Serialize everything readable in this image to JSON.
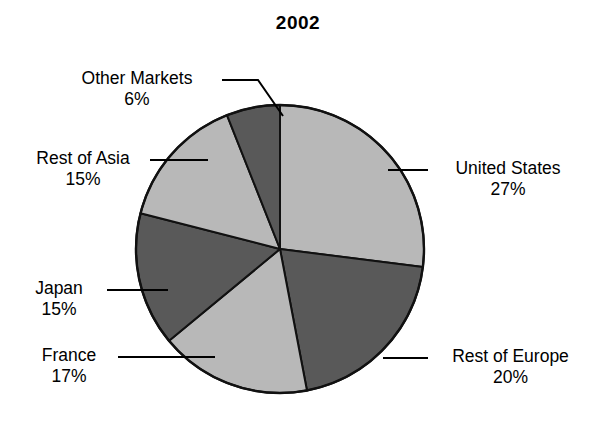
{
  "chart_data": {
    "type": "pie",
    "title": "2002",
    "xlabel": "",
    "ylabel": "",
    "legend": "none",
    "grid": false,
    "categories": [
      "United States",
      "Rest of Europe",
      "France",
      "Japan",
      "Rest of Asia",
      "Other Markets"
    ],
    "values": [
      27,
      20,
      17,
      15,
      15,
      6
    ],
    "value_suffix": "%",
    "start_angle_deg": 0,
    "direction": "clockwise",
    "slices": [
      {
        "label": "United States",
        "value": 27,
        "value_text": "27%",
        "color": "#b8b8b8",
        "tone": "light"
      },
      {
        "label": "Rest of Europe",
        "value": 20,
        "value_text": "20%",
        "color": "#595959",
        "tone": "dark"
      },
      {
        "label": "France",
        "value": 17,
        "value_text": "17%",
        "color": "#b8b8b8",
        "tone": "light"
      },
      {
        "label": "Japan",
        "value": 15,
        "value_text": "15%",
        "color": "#595959",
        "tone": "dark"
      },
      {
        "label": "Rest of Asia",
        "value": 15,
        "value_text": "15%",
        "color": "#b8b8b8",
        "tone": "light"
      },
      {
        "label": "Other Markets",
        "value": 6,
        "value_text": "6%",
        "color": "#595959",
        "tone": "dark"
      }
    ]
  },
  "labels": {
    "other_markets": {
      "name": "Other Markets",
      "pct": "6%"
    },
    "rest_of_asia": {
      "name": "Rest of Asia",
      "pct": "15%"
    },
    "japan": {
      "name": "Japan",
      "pct": "15%"
    },
    "france": {
      "name": "France",
      "pct": "17%"
    },
    "united_states": {
      "name": "United States",
      "pct": "27%"
    },
    "rest_of_europe": {
      "name": "Rest of Europe",
      "pct": "20%"
    }
  },
  "colors": {
    "light_slice": "#b8b8b8",
    "dark_slice": "#595959",
    "outline": "#111111",
    "background": "#ffffff",
    "text": "#000000"
  }
}
